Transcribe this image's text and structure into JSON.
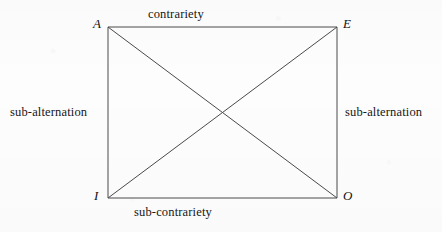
{
  "figure": {
    "kind": "square-of-opposition",
    "background_color": "#fdfdfd",
    "line_color": "#4a4a4a",
    "text_color": "#161616"
  },
  "square": {
    "left": 108,
    "top": 27,
    "right": 337,
    "bottom": 198,
    "diagonals": true
  },
  "vertices": [
    {
      "id": "A",
      "label": "A",
      "position": "top-left"
    },
    {
      "id": "E",
      "label": "E",
      "position": "top-right"
    },
    {
      "id": "I",
      "label": "I",
      "position": "bottom-left"
    },
    {
      "id": "O",
      "label": "O",
      "position": "bottom-right"
    }
  ],
  "edge_labels": {
    "top": "contrariety",
    "bottom": "sub-contrariety",
    "left": "sub-alternation",
    "right": "sub-alternation"
  }
}
